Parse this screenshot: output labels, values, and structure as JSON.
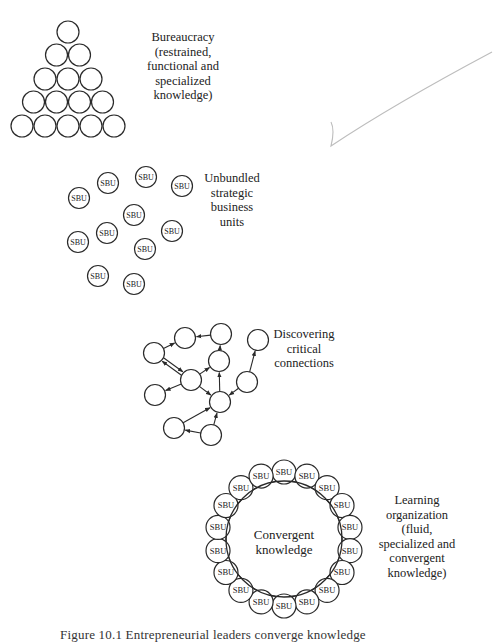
{
  "stages": {
    "bureaucracy": {
      "label": "Bureaucracy\n(restrained,\nfunctional and\nspecialized\nknowledge)"
    },
    "unbundled": {
      "label": "Unbundled\nstrategic\nbusiness\nunits",
      "unit_label": "SBU",
      "unit_count": 11
    },
    "connections": {
      "label": "Discovering\ncritical\nconnections",
      "node_count": 11
    },
    "learning": {
      "label": "Learning\norganization\n(fluid,\nspecialized and\nconvergent\nknowledge)",
      "center_label": "Convergent\nknowledge",
      "unit_label": "SBU",
      "unit_count": 18
    }
  },
  "caption": "Figure 10.1   Entrepreneurial leaders converge knowledge",
  "colors": {
    "stroke": "#2a2a2a",
    "pencil": "#b8b8b8",
    "background": "#ffffff"
  }
}
